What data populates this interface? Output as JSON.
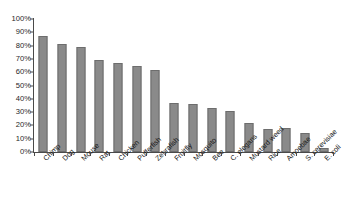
{
  "chart_data": {
    "type": "bar",
    "title": "",
    "subtitle": "",
    "xlabel": "",
    "ylabel": "",
    "ylim": [
      0,
      100
    ],
    "y_unit": "%",
    "grid": false,
    "legend": "none",
    "orientation": "vertical",
    "bar_color": "#8a8a8a",
    "bar_edge_color": "#6d6d6d",
    "axis_color": "#4a4a4a",
    "background_color": "#ffffff",
    "x_tick_label_rotation": -45,
    "y_ticks": [
      "100%",
      "90%",
      "80%",
      "70%",
      "60%",
      "50%",
      "40%",
      "30%",
      "20%",
      "10%",
      "0%"
    ],
    "y_tick_values": [
      100,
      90,
      80,
      70,
      60,
      50,
      40,
      30,
      20,
      10,
      0
    ],
    "categories": [
      "Chimp",
      "Dog",
      "Mouse",
      "Rat",
      "Chicken",
      "Pufferfish",
      "Zebrafish",
      "Fruitfly",
      "Mosquito",
      "Bee",
      "C. elegans",
      "Mustard weed",
      "Rice",
      "Amoebae",
      "S. cerevisiae",
      "E. coli"
    ],
    "values": [
      87,
      81,
      79,
      69,
      67,
      65,
      62,
      37,
      36,
      33,
      31,
      22,
      17,
      18,
      14,
      3
    ]
  }
}
